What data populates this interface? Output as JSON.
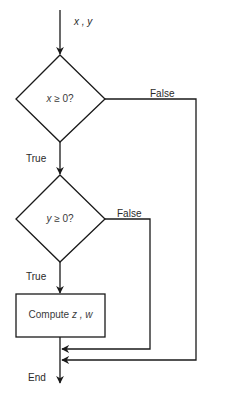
{
  "diagram": {
    "type": "flowchart",
    "input_label": {
      "vars": "x , y"
    },
    "nodes": [
      {
        "id": "decision-x",
        "shape": "diamond",
        "var": "x",
        "rest": " ≥ 0?"
      },
      {
        "id": "decision-y",
        "shape": "diamond",
        "var": "y",
        "rest": " ≥ 0?"
      },
      {
        "id": "process-compute",
        "shape": "rectangle",
        "prefix": "Compute ",
        "vars": "z , w"
      }
    ],
    "edge_labels": {
      "x_false": "False",
      "x_true": "True",
      "y_false": "False",
      "y_true": "True"
    },
    "end_label": "End",
    "colors": {
      "stroke": "#1a1a1a",
      "text": "#2a2a2a"
    }
  }
}
